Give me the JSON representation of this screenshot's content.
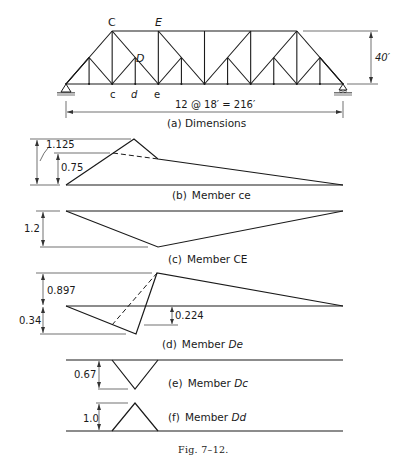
{
  "figure": {
    "caption": "Fig. 7–12.",
    "truss": {
      "caption": "(a)  Dimensions",
      "span_label": "12 @ 18′ = 216′",
      "height_label": "40′",
      "panels": 12,
      "panel_length_ft": 18,
      "span_ft": 216,
      "height_ft": 40,
      "node_labels": {
        "C": "C",
        "E": "E",
        "D": "D",
        "c": "c",
        "d": "d",
        "e": "e"
      }
    },
    "panels": [
      {
        "id": "b",
        "caption_prefix": "(b)",
        "caption_member": "Member ce",
        "member_italic": false,
        "labels": [
          "1.125",
          "0.75"
        ]
      },
      {
        "id": "c",
        "caption_prefix": "(c)",
        "caption_member": "Member CE",
        "member_italic": false,
        "labels": [
          "1.2"
        ]
      },
      {
        "id": "d",
        "caption_prefix": "(d)",
        "caption_member": "Member De",
        "member_italic": true,
        "labels": [
          "0.897",
          "0.34",
          "0.224"
        ]
      },
      {
        "id": "e",
        "caption_prefix": "(e)",
        "caption_member": "Member Dc",
        "member_italic": true,
        "labels": [
          "0.67"
        ]
      },
      {
        "id": "f",
        "caption_prefix": "(f)",
        "caption_member": "Member Dd",
        "member_italic": true,
        "labels": [
          "1.0"
        ]
      }
    ]
  },
  "chart_data": [
    {
      "type": "line",
      "title": "(b) Member ce — influence line",
      "x_unit": "panel point (0 = left support, 12 = right support)",
      "x": [
        0,
        3,
        4,
        12
      ],
      "values": [
        0,
        1.125,
        0.5,
        0
      ],
      "dashed_reference": {
        "x": [
          2,
          4
        ],
        "values": [
          0.75,
          0.5
        ]
      },
      "annotations": [
        "1.125",
        "0.75"
      ]
    },
    {
      "type": "line",
      "title": "(c) Member CE — influence line",
      "x": [
        0,
        4,
        12
      ],
      "values": [
        0,
        -1.2,
        0
      ],
      "annotations": [
        "1.2"
      ]
    },
    {
      "type": "line",
      "title": "(d) Member De — influence line",
      "x": [
        0,
        3,
        4,
        12
      ],
      "values": [
        0,
        -0.34,
        0.897,
        0
      ],
      "dashed_reference": {
        "x": [
          2,
          4
        ],
        "values": [
          -0.224,
          0.897
        ]
      },
      "annotations": [
        "0.897",
        "0.34",
        "0.224"
      ]
    },
    {
      "type": "line",
      "title": "(e) Member Dc — influence line",
      "x": [
        0,
        2,
        3,
        4,
        12
      ],
      "values": [
        0,
        0,
        -0.67,
        0,
        0
      ],
      "annotations": [
        "0.67"
      ]
    },
    {
      "type": "line",
      "title": "(f) Member Dd — influence line",
      "x": [
        0,
        2,
        3,
        4,
        12
      ],
      "values": [
        0,
        0,
        1.0,
        0,
        0
      ],
      "annotations": [
        "1.0"
      ]
    }
  ]
}
